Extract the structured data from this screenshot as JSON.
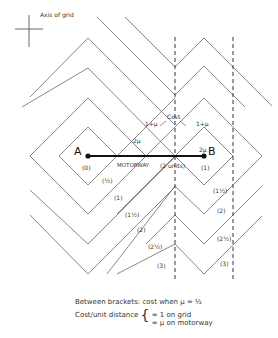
{
  "axis_label": "Axis of grid",
  "points": {
    "A": "A",
    "B": "B"
  },
  "motorway": {
    "label": "MOTORWAY",
    "length": "(2 units)"
  },
  "cost_label": "Cost",
  "edge_labels": {
    "one_plus_mu_left": "1+μ",
    "one_plus_mu_right": "1+μ",
    "two_mu_left": "2μ",
    "two_mu_right": "2μ"
  },
  "contour_values": {
    "A": "(0)",
    "B": "(1)",
    "left": [
      "(½)",
      "(1)",
      "(1½)",
      "(2)",
      "(2½)",
      "(3)"
    ],
    "right": [
      "(1½)",
      "(2)",
      "(2½)",
      "(3)"
    ]
  },
  "caption": {
    "line1": "Between brackets: cost when μ = ½",
    "line2_prefix": "Cost/unit distance",
    "line2_a": "= 1 on grid",
    "line2_b": "= μ on motorway"
  },
  "colors": {
    "line": "#555555",
    "motorway": "#111111"
  }
}
